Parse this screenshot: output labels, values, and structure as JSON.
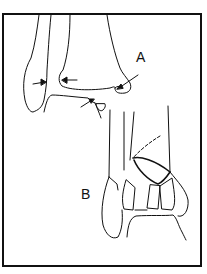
{
  "figure": {
    "panels": [
      {
        "id": "A",
        "label": "A",
        "description": "Ankle mortise line drawing with arrows indicating joint space / fracture sites"
      },
      {
        "id": "B",
        "label": "B",
        "description": "Comminuted distal tibial (pilon) fracture line drawing"
      }
    ],
    "arrows_in_panel_A": 4,
    "colors": {
      "line": "#111111",
      "background": "#ffffff"
    }
  }
}
